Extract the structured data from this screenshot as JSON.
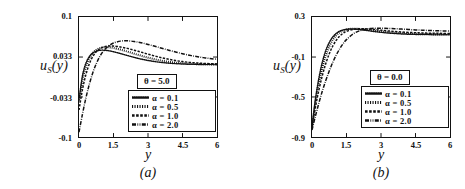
{
  "figure": {
    "panels": [
      {
        "id": "a",
        "caption": "(a)",
        "ylabel": "u",
        "ylabel_sub": "S",
        "ylabel_arg": "(y)",
        "xlabel": "y",
        "theta_label": "θ = 5.0",
        "yticks": [
          "0.1",
          "0.033",
          "-0.033",
          "-0.1"
        ],
        "xticks": [
          "0",
          "1.5",
          "3",
          "4.5",
          "6"
        ]
      },
      {
        "id": "b",
        "caption": "(b)",
        "ylabel": "u",
        "ylabel_sub": "S",
        "ylabel_arg": "(y)",
        "xlabel": "y",
        "theta_label": "θ = 0.0",
        "yticks": [
          "0.3",
          "-0.1",
          "-0.5",
          "-0.9"
        ],
        "xticks": [
          "0",
          "1.5",
          "3",
          "4.5",
          "6"
        ]
      }
    ],
    "legend_entries": [
      {
        "label": "α = 0.1",
        "style": "dotted-fine"
      },
      {
        "label": "α = 0.5",
        "style": "dotted-bold"
      },
      {
        "label": "α = 1.0",
        "style": "dashed"
      },
      {
        "label": "α = 2.0",
        "style": "dash-dot"
      }
    ],
    "colors": {
      "ink": "#111111",
      "background": "#ffffff"
    }
  },
  "chart_data": [
    {
      "type": "line",
      "panel": "a",
      "title": "",
      "xlabel": "y",
      "ylabel": "u_S(y)",
      "xlim": [
        0,
        6
      ],
      "ylim": [
        -0.1,
        0.1
      ],
      "xticks": [
        0,
        1.5,
        3,
        4.5,
        6
      ],
      "yticks": [
        -0.1,
        -0.033,
        0.033,
        0.1
      ],
      "grid": false,
      "legend_position": "lower-right",
      "annotation": "θ = 5.0",
      "x": [
        0,
        0.15,
        0.3,
        0.45,
        0.6,
        0.75,
        0.9,
        1.05,
        1.2,
        1.35,
        1.5,
        1.8,
        2.1,
        2.4,
        2.7,
        3,
        3.3,
        3.6,
        3.9,
        4.2,
        4.5,
        4.8,
        5.1,
        5.4,
        5.7,
        6
      ],
      "series": [
        {
          "name": "α = 0.1",
          "style": "dotted-fine",
          "values": [
            -0.038,
            0.002,
            0.023,
            0.034,
            0.04,
            0.043,
            0.0445,
            0.0448,
            0.0443,
            0.0434,
            0.0421,
            0.0391,
            0.0358,
            0.0327,
            0.0299,
            0.0276,
            0.0257,
            0.0242,
            0.0231,
            0.0223,
            0.0217,
            0.0213,
            0.021,
            0.0208,
            0.0207,
            0.0206
          ]
        },
        {
          "name": "α = 0.5",
          "style": "dotted-bold",
          "values": [
            -0.042,
            -0.006,
            0.017,
            0.031,
            0.04,
            0.0452,
            0.0481,
            0.0494,
            0.0497,
            0.0493,
            0.0484,
            0.0457,
            0.0424,
            0.0389,
            0.0354,
            0.0322,
            0.0294,
            0.0271,
            0.0253,
            0.0239,
            0.0229,
            0.0222,
            0.0217,
            0.0213,
            0.0211,
            0.021
          ]
        },
        {
          "name": "α = 1.0",
          "style": "dashed",
          "values": [
            -0.055,
            -0.021,
            0.004,
            0.022,
            0.034,
            0.042,
            0.047,
            0.0498,
            0.0512,
            0.0517,
            0.0515,
            0.0501,
            0.0477,
            0.0447,
            0.0414,
            0.0381,
            0.0349,
            0.032,
            0.0295,
            0.0274,
            0.0257,
            0.0244,
            0.0234,
            0.0227,
            0.0222,
            0.0218
          ]
        },
        {
          "name": "α = 2.0",
          "style": "dash-dot",
          "values": [
            -0.092,
            -0.062,
            -0.035,
            -0.012,
            0.007,
            0.022,
            0.034,
            0.0426,
            0.049,
            0.0535,
            0.0566,
            0.0598,
            0.0603,
            0.0592,
            0.0571,
            0.0543,
            0.0512,
            0.0479,
            0.0447,
            0.0416,
            0.0388,
            0.0363,
            0.0341,
            0.0323,
            0.0308,
            0.0296
          ]
        }
      ]
    },
    {
      "type": "line",
      "panel": "b",
      "title": "",
      "xlabel": "y",
      "ylabel": "u_S(y)",
      "xlim": [
        0,
        6
      ],
      "ylim": [
        -0.9,
        0.3
      ],
      "xticks": [
        0,
        1.5,
        3,
        4.5,
        6
      ],
      "yticks": [
        -0.9,
        -0.5,
        -0.1,
        0.3
      ],
      "grid": false,
      "legend_position": "lower-right",
      "annotation": "θ = 0.0",
      "x": [
        0,
        0.15,
        0.3,
        0.45,
        0.6,
        0.75,
        0.9,
        1.05,
        1.2,
        1.35,
        1.5,
        1.8,
        2.1,
        2.4,
        2.7,
        3,
        3.3,
        3.6,
        3.9,
        4.2,
        4.5,
        4.8,
        5.1,
        5.4,
        5.7,
        6
      ],
      "series": [
        {
          "name": "α = 0.1",
          "style": "dotted-fine",
          "values": [
            -0.8,
            -0.52,
            -0.31,
            -0.15,
            -0.035,
            0.045,
            0.1,
            0.135,
            0.158,
            0.17,
            0.177,
            0.18,
            0.174,
            0.165,
            0.155,
            0.147,
            0.14,
            0.135,
            0.131,
            0.128,
            0.126,
            0.125,
            0.124,
            0.123,
            0.123,
            0.122
          ]
        },
        {
          "name": "α = 0.5",
          "style": "dotted-bold",
          "values": [
            -0.8,
            -0.555,
            -0.36,
            -0.205,
            -0.085,
            0.005,
            0.07,
            0.115,
            0.145,
            0.164,
            0.175,
            0.183,
            0.18,
            0.173,
            0.164,
            0.156,
            0.149,
            0.143,
            0.138,
            0.135,
            0.132,
            0.13,
            0.129,
            0.128,
            0.127,
            0.127
          ]
        },
        {
          "name": "α = 1.0",
          "style": "dashed",
          "values": [
            -0.8,
            -0.6,
            -0.43,
            -0.285,
            -0.165,
            -0.068,
            0.008,
            0.066,
            0.108,
            0.137,
            0.157,
            0.177,
            0.183,
            0.181,
            0.175,
            0.168,
            0.161,
            0.155,
            0.15,
            0.146,
            0.143,
            0.14,
            0.138,
            0.137,
            0.136,
            0.135
          ]
        },
        {
          "name": "α = 2.0",
          "style": "dash-dot",
          "values": [
            -0.83,
            -0.69,
            -0.56,
            -0.44,
            -0.335,
            -0.24,
            -0.155,
            -0.082,
            -0.02,
            0.032,
            0.074,
            0.133,
            0.165,
            0.181,
            0.187,
            0.188,
            0.186,
            0.183,
            0.179,
            0.175,
            0.171,
            0.168,
            0.165,
            0.163,
            0.161,
            0.159
          ]
        }
      ]
    }
  ]
}
